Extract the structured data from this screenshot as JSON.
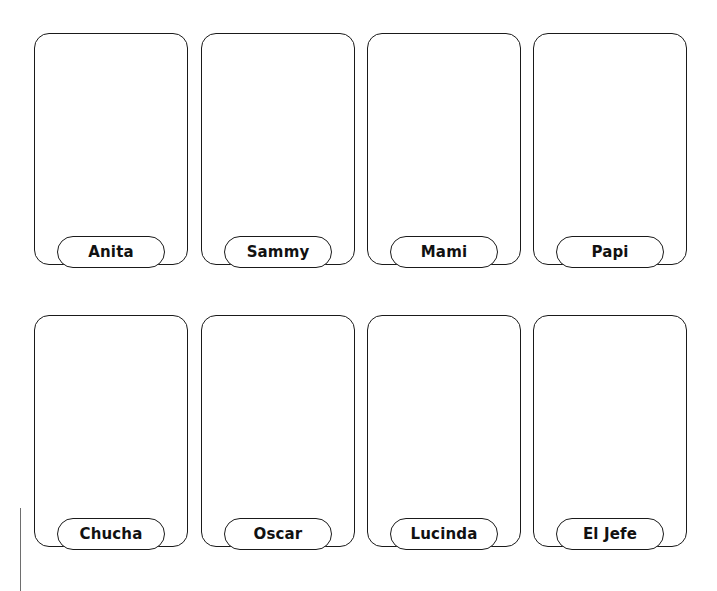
{
  "page": {
    "background_color": "#ffffff",
    "ink_color": "#1a1a1a",
    "text_color": "#111111",
    "width": 717,
    "height": 591
  },
  "artifact": {
    "name": "scan-edge-line",
    "color": "#6e6e6e",
    "x": 20,
    "y": 508,
    "width": 1,
    "height": 83
  },
  "layout": {
    "card_width": 154,
    "card_height": 232,
    "card_radius": 15,
    "pill_width": 108,
    "pill_height": 32,
    "columns_x": [
      34,
      201,
      367,
      533
    ],
    "rows_y": [
      33,
      315
    ],
    "row_gap": 50,
    "column_gap": 13
  },
  "cards": [
    {
      "label": "Anita",
      "row": 0,
      "column": 0
    },
    {
      "label": "Sammy",
      "row": 0,
      "column": 1
    },
    {
      "label": "Mami",
      "row": 0,
      "column": 2
    },
    {
      "label": "Papi",
      "row": 0,
      "column": 3
    },
    {
      "label": "Chucha",
      "row": 1,
      "column": 0
    },
    {
      "label": "Oscar",
      "row": 1,
      "column": 1
    },
    {
      "label": "Lucinda",
      "row": 1,
      "column": 2
    },
    {
      "label": "El Jefe",
      "row": 1,
      "column": 3
    }
  ]
}
